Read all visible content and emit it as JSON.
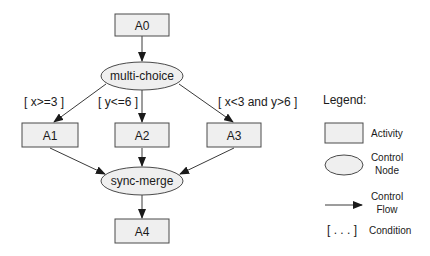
{
  "diagram": {
    "nodes": {
      "a0": {
        "label": "A0",
        "type": "activity"
      },
      "multi_choice": {
        "label": "multi-choice",
        "type": "control-node"
      },
      "a1": {
        "label": "A1",
        "type": "activity"
      },
      "a2": {
        "label": "A2",
        "type": "activity"
      },
      "a3": {
        "label": "A3",
        "type": "activity"
      },
      "sync_merge": {
        "label": "sync-merge",
        "type": "control-node"
      },
      "a4": {
        "label": "A4",
        "type": "activity"
      }
    },
    "edges": [
      {
        "from": "A0",
        "to": "multi-choice"
      },
      {
        "from": "multi-choice",
        "to": "A1",
        "condition": "[ x>=3 ]"
      },
      {
        "from": "multi-choice",
        "to": "A2",
        "condition": "[ y<=6 ]"
      },
      {
        "from": "multi-choice",
        "to": "A3",
        "condition": "[ x<3 and y>6 ]"
      },
      {
        "from": "A1",
        "to": "sync-merge"
      },
      {
        "from": "A2",
        "to": "sync-merge"
      },
      {
        "from": "A3",
        "to": "sync-merge"
      },
      {
        "from": "sync-merge",
        "to": "A4"
      }
    ],
    "conditions": {
      "c1": "[ x>=3 ]",
      "c2": "[ y<=6 ]",
      "c3": "[ x<3 and y>6 ]"
    }
  },
  "legend": {
    "title": "Legend:",
    "activity": "Activity",
    "control_node_line1": "Control",
    "control_node_line2": "Node",
    "control_flow_line1": "Control",
    "control_flow_line2": "Flow",
    "condition_symbol": "[ . . . ]",
    "condition": "Condition"
  },
  "colors": {
    "node_fill": "#efefef",
    "stroke": "#4a4a4a",
    "text": "#1a1a1a"
  }
}
